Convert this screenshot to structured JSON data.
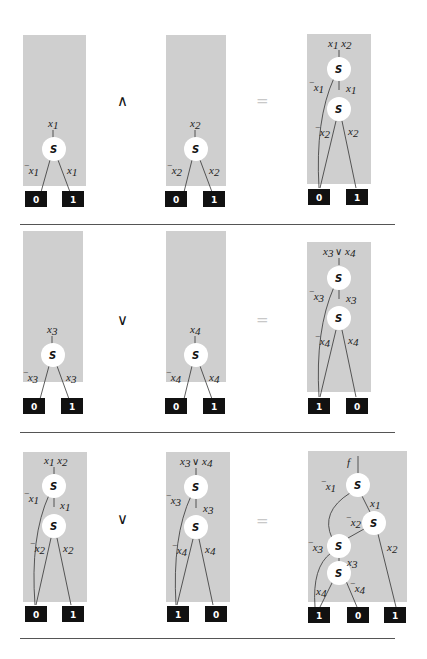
{
  "figure": {
    "rows": [
      {
        "operator": "∧",
        "equals": "=",
        "left": {
          "label": "x1",
          "neg_edge": "¬x1",
          "pos_edge": "x1",
          "terminals": [
            "0",
            "1"
          ]
        },
        "middle": {
          "label": "x2",
          "neg_edge": "¬x2",
          "pos_edge": "x2",
          "terminals": [
            "0",
            "1"
          ]
        },
        "result": {
          "label": "x1 x2",
          "nodes": [
            "s",
            "s"
          ],
          "edges": [
            "¬x1",
            "x1",
            "¬x2",
            "x2"
          ],
          "terminals": [
            "0",
            "1"
          ]
        }
      },
      {
        "operator": "∨",
        "equals": "=",
        "left": {
          "label": "x3",
          "neg_edge": "¬x3",
          "pos_edge": "x3",
          "terminals": [
            "0",
            "1"
          ]
        },
        "middle": {
          "label": "x4",
          "neg_edge": "¬x4",
          "pos_edge": "x4",
          "terminals": [
            "0",
            "1"
          ]
        },
        "result": {
          "label": "x3 ∨ x4",
          "nodes": [
            "s",
            "s"
          ],
          "edges": [
            "¬x3",
            "x3",
            "¬x4",
            "x4"
          ],
          "terminals": [
            "1",
            "0"
          ]
        }
      },
      {
        "operator": "∨",
        "equals": "=",
        "left": {
          "label": "x1 x2",
          "edges": [
            "¬x1",
            "x1",
            "¬x2",
            "x2"
          ],
          "terminals": [
            "0",
            "1"
          ]
        },
        "middle": {
          "label": "x3 ∨ x4",
          "edges": [
            "¬x3",
            "x3",
            "¬x4",
            "x4"
          ],
          "terminals": [
            "1",
            "0"
          ]
        },
        "result": {
          "label": "f",
          "nodes": [
            "s",
            "s",
            "s",
            "s"
          ],
          "edges": [
            "¬x1",
            "x1",
            "¬x2",
            "x2",
            "¬x3",
            "x3",
            "x4",
            "¬x4"
          ],
          "terminals": [
            "1",
            "0",
            "1"
          ]
        }
      }
    ],
    "node_label": "S",
    "colors": {
      "panel": "#cfcfcf",
      "terminal": "#111111",
      "terminal_text": "#ffffff",
      "node_fill": "#ffffff",
      "separator": "#555555",
      "equals": "#c8c8c8"
    }
  }
}
